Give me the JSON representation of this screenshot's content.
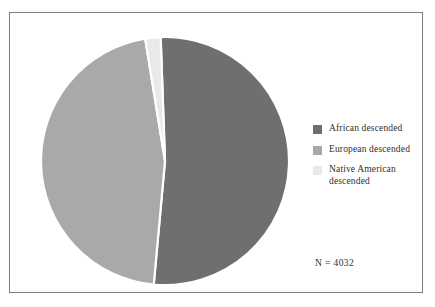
{
  "figure": {
    "background_color": "#ffffff",
    "frame_color": "#7d7d83",
    "sample_size_label": "N = 4032"
  },
  "legend": {
    "position": "right",
    "items": [
      {
        "label": "African descended",
        "color": "#6f6f6f",
        "swatch_name": "legend-swatch-african-descended"
      },
      {
        "label": "European descended",
        "color": "#a9a9a9",
        "swatch_name": "legend-swatch-european-descended"
      },
      {
        "label": "Native American\ndescended",
        "color": "#e9e9e9",
        "swatch_name": "legend-swatch-native-american-descended"
      }
    ]
  },
  "chart_data": {
    "type": "pie",
    "title": "",
    "subtitle": "",
    "xlabel": "",
    "ylabel": "",
    "grid": false,
    "legend_position": "right",
    "total_n": 4032,
    "annotations": [
      "N = 4032"
    ],
    "categories": [
      "African descended",
      "European descended",
      "Native American descended"
    ],
    "values": [
      52.0,
      46.0,
      2.0
    ],
    "units": "percent",
    "colors": [
      "#6f6f6f",
      "#a9a9a9",
      "#e9e9e9"
    ],
    "slice_separator_color": "#ffffff",
    "start_angle_deg": -2,
    "direction": "clockwise",
    "slices": [
      {
        "label": "African descended",
        "value": 52.0,
        "color": "#6f6f6f"
      },
      {
        "label": "European descended",
        "value": 46.0,
        "color": "#a9a9a9"
      },
      {
        "label": "Native American descended",
        "value": 2.0,
        "color": "#e9e9e9"
      }
    ]
  }
}
